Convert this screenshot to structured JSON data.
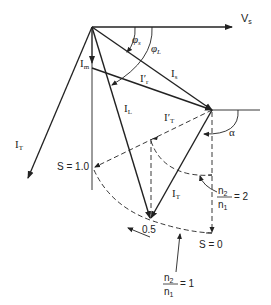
{
  "diagram": {
    "title": "",
    "type": "phasor diagram",
    "labels": {
      "vs": "V",
      "vs_sub": "s",
      "phi_s": "φ",
      "phi_s_sub": "s",
      "phi_l": "φ",
      "phi_l_sub": "L",
      "i_m": "I",
      "i_m_sub": "m",
      "i_r_prime": "I′",
      "i_r_prime_sub": "r",
      "i_s": "I",
      "i_s_sub": "s",
      "i_l": "I",
      "i_l_sub": "L",
      "i_t_left": "I",
      "i_t_left_sub": "T",
      "i_t_prime": "I′",
      "i_t_prime_sub": "T",
      "i_t": "I",
      "i_t_sub": "T",
      "alpha": "α",
      "s_one": "S = 1.0",
      "half": "0.5",
      "s_zero": "S = 0",
      "ratio2_num": "n",
      "ratio2_num_sub": "2",
      "ratio2_den": "n",
      "ratio2_den_sub": "1",
      "ratio2_val": "= 2",
      "ratio1_num": "n",
      "ratio1_num_sub": "2",
      "ratio1_den": "n",
      "ratio1_den_sub": "1",
      "ratio1_val": "= 1"
    },
    "colors": {
      "line": "#222222",
      "background": "#ffffff"
    }
  }
}
